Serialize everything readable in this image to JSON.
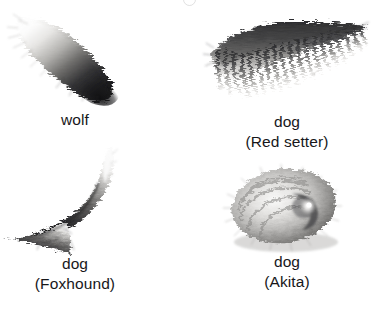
{
  "figure": {
    "background_color": "#ffffff",
    "text_color": "#17171a",
    "layout": "2x2 grid of grayscale canine tail illustrations with centered captions",
    "top_cropped_artifact": "partial descender glyph cut off at top edge"
  },
  "specimens": [
    {
      "id": "wolf",
      "icon": "wolf-tail-illustration",
      "caption": "wolf",
      "subcaption": "",
      "description": "straight brush tail, pale grizzled base fading to a dark near-black tip, angled down to the right",
      "tone_light": "#f2f1ef",
      "tone_mid": "#8d8c8a",
      "tone_dark": "#1c1c1e"
    },
    {
      "id": "red-setter",
      "icon": "red-setter-tail-illustration",
      "caption": "dog",
      "subcaption": "(Red setter)",
      "description": "feathered banner tail with long hanging fringe, dark along the upper spine fading lighter at the hair tips",
      "tone_light": "#efeeec",
      "tone_mid": "#7b7a78",
      "tone_dark": "#2a2a2c"
    },
    {
      "id": "foxhound",
      "icon": "foxhound-tail-illustration",
      "caption": "dog",
      "subcaption": "(Foxhound)",
      "description": "upright curved sabre tail, white tip at the top sweeping down into a dark flared base to the lower left",
      "tone_light": "#f4f3f1",
      "tone_mid": "#868583",
      "tone_dark": "#232325"
    },
    {
      "id": "akita",
      "icon": "akita-tail-illustration",
      "caption": "dog",
      "subcaption": "(Akita)",
      "description": "tightly curled spiral tail coiled over the back with a bright white highlight at the centre of the curl",
      "tone_light": "#f6f5f4",
      "tone_mid": "#9b9a98",
      "tone_dark": "#3a3a3c"
    }
  ]
}
